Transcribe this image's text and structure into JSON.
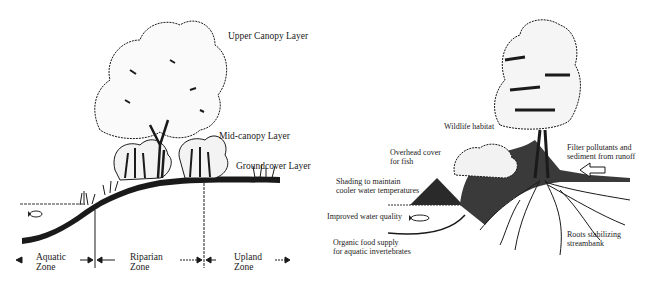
{
  "left_panel": {
    "layers": {
      "upper_canopy": "Upper Canopy Layer",
      "mid_canopy": "Mid-canopy Layer",
      "groundcover": "Groundcover Layer"
    },
    "zones": [
      {
        "line1": "Aquatic",
        "line2": "Zone"
      },
      {
        "line1": "Riparian",
        "line2": "Zone"
      },
      {
        "line1": "Upland",
        "line2": "Zone"
      }
    ]
  },
  "right_panel": {
    "benefits": {
      "wildlife_habitat": "Wildlife habitat",
      "overhead_cover": [
        "Overhead cover",
        "for fish"
      ],
      "shading": [
        "Shading to maintain",
        "cooler water temperatures"
      ],
      "water_quality": "Improved water quality",
      "food_supply": [
        "Organic food supply",
        "for aquatic invertebrates"
      ],
      "filter": [
        "Filter pollutants and",
        "sediment from runoff"
      ],
      "roots": [
        "Roots stabilizing",
        "streambank"
      ]
    }
  },
  "colors": {
    "ink": "#1a1a1a",
    "background": "#ffffff"
  }
}
